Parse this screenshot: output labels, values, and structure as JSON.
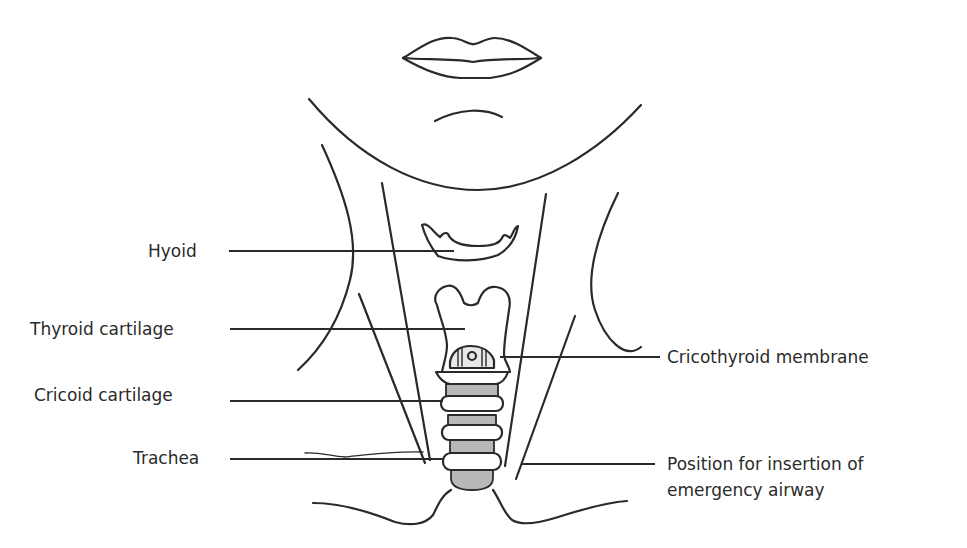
{
  "diagram": {
    "colors": {
      "line": "#2a2a2a",
      "trachea_fill": "#b8b8b8",
      "background": "#ffffff"
    },
    "labels_left": [
      {
        "id": "hyoid",
        "text": "Hyoid"
      },
      {
        "id": "thyroid",
        "text": "Thyroid cartilage"
      },
      {
        "id": "cricoid",
        "text": "Cricoid cartilage"
      },
      {
        "id": "trachea",
        "text": "Trachea"
      }
    ],
    "labels_right": [
      {
        "id": "cricothyroid",
        "text": "Cricothyroid membrane"
      },
      {
        "id": "airway_position",
        "line1": "Position for insertion of",
        "line2": "emergency airway"
      }
    ]
  }
}
